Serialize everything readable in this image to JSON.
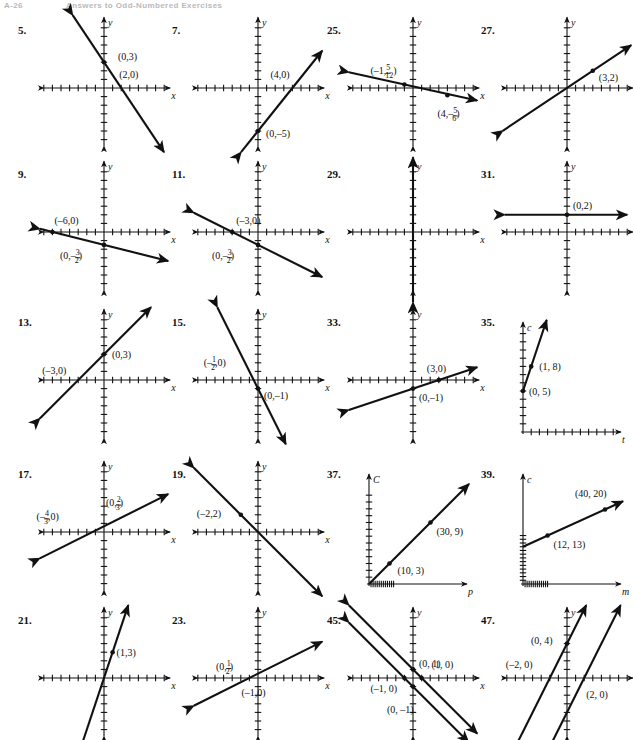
{
  "page": {
    "folio": "A-26",
    "running_head": "Answers to Odd-Numbered Exercises"
  },
  "figures": [
    {
      "number": "5.",
      "col": 0,
      "row": 0,
      "axes": {
        "x_label": "x",
        "y_label": "y",
        "type": "four-quadrant"
      },
      "lines": [
        {
          "slope": -1.5,
          "intercept": 3,
          "arrows": "both"
        }
      ],
      "points": [
        {
          "label": "(0,3)",
          "x": 0,
          "y": 3,
          "dot": true,
          "lx": 14,
          "ly": -2
        },
        {
          "label": "(2,0)",
          "x": 2,
          "y": 0,
          "dot": false,
          "lx": -2,
          "ly": -10
        }
      ]
    },
    {
      "number": "7.",
      "col": 1,
      "row": 0,
      "axes": {
        "x_label": "x",
        "y_label": "y",
        "type": "four-quadrant"
      },
      "lines": [
        {
          "slope": 1.25,
          "intercept": -5,
          "arrows": "both"
        }
      ],
      "points": [
        {
          "label": "(4,0)",
          "x": 4,
          "y": 0,
          "dot": false,
          "lx": -22,
          "ly": -10
        },
        {
          "label": "(0,–5)",
          "x": 0,
          "y": -5,
          "dot": true,
          "lx": 8,
          "ly": 6
        }
      ]
    },
    {
      "number": "25.",
      "col": 2,
      "row": 0,
      "axes": {
        "x_label": "x",
        "y_label": "y",
        "type": "four-quadrant"
      },
      "lines": [
        {
          "slope": -0.22,
          "intercept": 0.2,
          "arrows": "both"
        }
      ],
      "points": [
        {
          "label": "(–1, 5/12)",
          "tex": "(-1, 5/12)",
          "x": -1,
          "y": 0.41,
          "dot": true,
          "lx": -34,
          "ly": -10,
          "fraction": {
            "prefix": "(–1,",
            "num": "5",
            "den": "12",
            "suffix": ")"
          }
        },
        {
          "label": "(4, –5/6)",
          "tex": "(4,-5/6)",
          "x": 4,
          "y": -0.83,
          "dot": true,
          "lx": -10,
          "ly": 22,
          "fraction": {
            "prefix": "(4,–",
            "num": "5",
            "den": "6",
            "suffix": ")"
          }
        }
      ]
    },
    {
      "number": "27.",
      "col": 3,
      "row": 0,
      "axes": {
        "x_label": "x",
        "y_label": "y",
        "type": "four-quadrant"
      },
      "lines": [
        {
          "slope": 0.6667,
          "intercept": 0,
          "arrows": "both"
        }
      ],
      "points": [
        {
          "label": "(3,2)",
          "x": 3,
          "y": 2,
          "dot": true,
          "lx": 6,
          "ly": 10
        }
      ]
    },
    {
      "number": "9.",
      "col": 0,
      "row": 1,
      "axes": {
        "x_label": "x",
        "y_label": "y",
        "type": "four-quadrant"
      },
      "lines": [
        {
          "slope": -0.25,
          "intercept": -1.5,
          "arrows": "both"
        }
      ],
      "points": [
        {
          "label": "(–6,0)",
          "x": -6,
          "y": 0,
          "dot": true,
          "lx": 2,
          "ly": -8
        },
        {
          "label": "(0,–3/2)",
          "x": 0,
          "y": -1.5,
          "dot": true,
          "lx": -44,
          "ly": 14,
          "fraction": {
            "prefix": "(0,–",
            "num": "3",
            "den": "2",
            "suffix": ")"
          }
        }
      ]
    },
    {
      "number": "11.",
      "col": 1,
      "row": 1,
      "axes": {
        "x_label": "x",
        "y_label": "y",
        "type": "four-quadrant"
      },
      "lines": [
        {
          "slope": -0.5,
          "intercept": -1.5,
          "arrows": "both"
        }
      ],
      "points": [
        {
          "label": "(–3,0)",
          "x": -3,
          "y": 0,
          "dot": true,
          "lx": 4,
          "ly": -8
        },
        {
          "label": "(0,–3/2)",
          "x": 0,
          "y": -1.5,
          "dot": true,
          "lx": -46,
          "ly": 14,
          "fraction": {
            "prefix": "(0,–",
            "num": "3",
            "den": "2",
            "suffix": ")"
          }
        }
      ]
    },
    {
      "number": "29.",
      "col": 2,
      "row": 1,
      "axes": {
        "x_label": "x",
        "y_label": "y",
        "type": "four-quadrant"
      },
      "lines": [
        {
          "vertical": true,
          "x": 0,
          "arrows": "both"
        }
      ],
      "points": []
    },
    {
      "number": "31.",
      "col": 3,
      "row": 1,
      "axes": {
        "x_label": "x",
        "y_label": "y",
        "type": "four-quadrant"
      },
      "lines": [
        {
          "horizontal": true,
          "y": 2,
          "arrows": "both"
        }
      ],
      "points": [
        {
          "label": "(0,2)",
          "x": 0,
          "y": 2,
          "dot": true,
          "lx": 6,
          "ly": -6
        }
      ]
    },
    {
      "number": "13.",
      "col": 0,
      "row": 2,
      "axes": {
        "x_label": "x",
        "y_label": "y",
        "type": "four-quadrant"
      },
      "lines": [
        {
          "slope": 1.0,
          "intercept": 3,
          "arrows": "both"
        }
      ],
      "points": [
        {
          "label": "(0,3)",
          "x": 0,
          "y": 3,
          "dot": true,
          "lx": 8,
          "ly": 4
        },
        {
          "label": "(–3,0)",
          "x": -3,
          "y": 0,
          "dot": false,
          "lx": -36,
          "ly": -6
        }
      ]
    },
    {
      "number": "15.",
      "col": 1,
      "row": 2,
      "axes": {
        "x_label": "x",
        "y_label": "y",
        "type": "four-quadrant"
      },
      "lines": [
        {
          "slope": -2.0,
          "intercept": -1,
          "arrows": "both"
        }
      ],
      "points": [
        {
          "label": "(–1/2,0)",
          "x": -0.5,
          "y": 0,
          "dot": false,
          "lx": -50,
          "ly": -14,
          "fraction": {
            "prefix": "(–",
            "num": "1",
            "den": "2",
            "suffix": ",0)"
          }
        },
        {
          "label": "(0,–1)",
          "x": 0,
          "y": -1,
          "dot": true,
          "lx": 6,
          "ly": 10
        }
      ]
    },
    {
      "number": "33.",
      "col": 2,
      "row": 2,
      "axes": {
        "x_label": "x",
        "y_label": "y",
        "type": "four-quadrant"
      },
      "lines": [
        {
          "slope": 0.3333,
          "intercept": -1,
          "arrows": "both"
        }
      ],
      "points": [
        {
          "label": "(3,0)",
          "x": 3,
          "y": 0,
          "dot": true,
          "lx": -12,
          "ly": -8
        },
        {
          "label": "(0,–1)",
          "x": 0,
          "y": -1,
          "dot": true,
          "lx": 6,
          "ly": 12
        }
      ]
    },
    {
      "number": "35.",
      "col": 3,
      "row": 2,
      "axes": {
        "x_label": "t",
        "y_label": "c",
        "type": "first-quadrant"
      },
      "lines": [
        {
          "slope": 3,
          "intercept": 5,
          "arrows": "up"
        }
      ],
      "points": [
        {
          "label": "(1, 8)",
          "x": 1,
          "y": 8,
          "dot": true,
          "lx": 8,
          "ly": 4
        },
        {
          "label": "(0, 5)",
          "x": 0,
          "y": 5,
          "dot": true,
          "lx": 6,
          "ly": 4
        }
      ]
    },
    {
      "number": "17.",
      "col": 0,
      "row": 3,
      "axes": {
        "x_label": "x",
        "y_label": "y",
        "type": "four-quadrant"
      },
      "lines": [
        {
          "slope": 0.5,
          "intercept": 0.6667,
          "arrows": "both"
        }
      ],
      "points": [
        {
          "label": "(0,2/3)",
          "x": 0,
          "y": 0.6667,
          "dot": false,
          "lx": 2,
          "ly": -20,
          "fraction": {
            "prefix": "(0,",
            "num": "2",
            "den": "3",
            "suffix": ")"
          }
        },
        {
          "label": "(–4/3,0)",
          "x": -1.3333,
          "y": 0,
          "dot": false,
          "lx": -56,
          "ly": -12,
          "fraction": {
            "prefix": "(–",
            "num": "4",
            "den": "3",
            "suffix": ",0)"
          }
        }
      ]
    },
    {
      "number": "19.",
      "col": 1,
      "row": 3,
      "axes": {
        "x_label": "x",
        "y_label": "y",
        "type": "four-quadrant"
      },
      "lines": [
        {
          "slope": -1.0,
          "intercept": 0,
          "arrows": "both"
        }
      ],
      "points": [
        {
          "label": "(–2,2)",
          "x": -2,
          "y": 2,
          "dot": true,
          "lx": -44,
          "ly": 2
        }
      ]
    },
    {
      "number": "37.",
      "col": 2,
      "row": 3,
      "axes": {
        "x_label": "p",
        "y_label": "C",
        "type": "first-quadrant"
      },
      "lines": [
        {
          "slope": 0.3,
          "intercept": 0,
          "arrows": "up"
        }
      ],
      "points": [
        {
          "label": "(10, 3)",
          "x": 10,
          "y": 3,
          "dot": true,
          "lx": 8,
          "ly": 10
        },
        {
          "label": "(30, 9)",
          "x": 30,
          "y": 9,
          "dot": true,
          "lx": 6,
          "ly": 12
        }
      ]
    },
    {
      "number": "39.",
      "col": 3,
      "row": 3,
      "axes": {
        "x_label": "m",
        "y_label": "c",
        "type": "first-quadrant"
      },
      "lines": [
        {
          "slope": 0.25,
          "intercept": 10,
          "arrows": "up"
        }
      ],
      "points": [
        {
          "label": "(12, 13)",
          "x": 12,
          "y": 13,
          "dot": true,
          "lx": 6,
          "ly": 12
        },
        {
          "label": "(40, 20)",
          "x": 40,
          "y": 20,
          "dot": true,
          "lx": -30,
          "ly": -12
        }
      ]
    },
    {
      "number": "21.",
      "col": 0,
      "row": 4,
      "axes": {
        "x_label": "x",
        "y_label": "y",
        "type": "four-quadrant"
      },
      "lines": [
        {
          "slope": 3,
          "intercept": 0,
          "arrows": "both"
        }
      ],
      "points": [
        {
          "label": "(1,3)",
          "x": 1,
          "y": 3,
          "dot": true,
          "lx": 4,
          "ly": 4
        }
      ]
    },
    {
      "number": "23.",
      "col": 1,
      "row": 4,
      "axes": {
        "x_label": "x",
        "y_label": "y",
        "type": "four-quadrant"
      },
      "lines": [
        {
          "slope": 0.5,
          "intercept": 0.5,
          "arrows": "both"
        }
      ],
      "points": [
        {
          "label": "(0,1/2)",
          "x": 0,
          "y": 0.5,
          "dot": false,
          "lx": -42,
          "ly": -4,
          "fraction": {
            "prefix": "(0,",
            "num": "1",
            "den": "2",
            "suffix": ")"
          }
        },
        {
          "label": "(–1,0)",
          "x": -1,
          "y": 0,
          "dot": false,
          "lx": -8,
          "ly": 18
        }
      ]
    },
    {
      "number": "45.",
      "col": 2,
      "row": 4,
      "axes": {
        "x_label": "x",
        "y_label": "y",
        "type": "four-quadrant"
      },
      "lines": [
        {
          "slope": -1,
          "intercept": 1,
          "arrows": "both"
        },
        {
          "slope": -1,
          "intercept": -1,
          "arrows": "both"
        }
      ],
      "points": [
        {
          "label": "(0, 1)",
          "x": 0,
          "y": 1,
          "dot": true,
          "lx": 6,
          "ly": -2
        },
        {
          "label": "(1, 0)",
          "x": 1,
          "y": 0,
          "dot": true,
          "lx": 10,
          "ly": -10
        },
        {
          "label": "(–1, 0)",
          "x": -1,
          "y": 0,
          "dot": true,
          "lx": -34,
          "ly": 14
        },
        {
          "label": "(0, –1)",
          "x": 0,
          "y": -1,
          "dot": true,
          "lx": -26,
          "ly": 26
        }
      ]
    },
    {
      "number": "47.",
      "col": 3,
      "row": 4,
      "axes": {
        "x_label": "x",
        "y_label": "y",
        "type": "four-quadrant"
      },
      "lines": [
        {
          "slope": 2,
          "intercept": 4,
          "arrows": "up"
        },
        {
          "slope": 2,
          "intercept": -4,
          "arrows": "up"
        }
      ],
      "points": [
        {
          "label": "(0, 4)",
          "x": 0,
          "y": 4,
          "dot": true,
          "lx": -36,
          "ly": 0
        },
        {
          "label": "(–2, 0)",
          "x": -2,
          "y": 0,
          "dot": false,
          "lx": -44,
          "ly": -10
        },
        {
          "label": "(2, 0)",
          "x": 2,
          "y": 0,
          "dot": false,
          "lx": 2,
          "ly": 20
        }
      ]
    }
  ]
}
